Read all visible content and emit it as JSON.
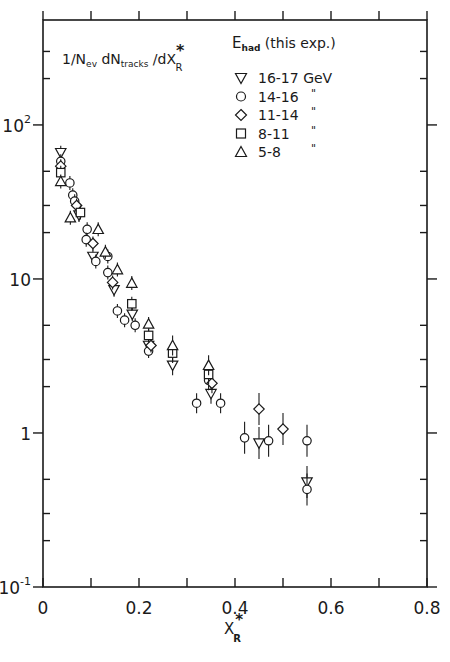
{
  "chart_data": {
    "type": "scatter",
    "title": "",
    "ylabel": "1/N_ev dN_tracks/dX_R*",
    "ylabel_parts": {
      "main": "1/N",
      "sub1": "ev",
      "mid": " dN",
      "sub2": "tracks",
      "tail": " /dX",
      "sup": "*",
      "sub3": "R"
    },
    "xlabel": "X_R*",
    "xlabel_parts": {
      "main": "X",
      "sup": "*",
      "sub": "R"
    },
    "xlim": [
      0,
      0.8
    ],
    "ylim": [
      0.1,
      480
    ],
    "yscale": "log",
    "grid": false,
    "x_ticks": [
      0,
      0.2,
      0.4,
      0.6,
      0.8
    ],
    "x_tick_labels": [
      "0",
      "0.2",
      "0.4",
      "0.6",
      "0.8"
    ],
    "x_minor_ticks": [
      0.1,
      0.3,
      0.5,
      0.7
    ],
    "y_tick_labels": [
      {
        "value": 100,
        "base": "10",
        "exp": "2"
      },
      {
        "value": 10,
        "base": "10",
        "exp": ""
      },
      {
        "value": 1,
        "base": "1",
        "exp": ""
      },
      {
        "value": 0.1,
        "base": "10",
        "exp": "-1"
      }
    ],
    "y_minor_ticks": [
      200,
      300,
      50,
      30,
      20,
      5,
      3,
      2,
      0.5,
      0.3,
      0.2
    ],
    "legend": {
      "title_main": "E",
      "title_sub": "had",
      "title_tail": " (this exp.)",
      "position": "upper right",
      "entries": [
        {
          "marker": "triangle-down",
          "label": "16-17 GeV"
        },
        {
          "marker": "circle",
          "label": "14-16",
          "ditto": "\""
        },
        {
          "marker": "diamond",
          "label": "11-14",
          "ditto": "\""
        },
        {
          "marker": "square",
          "label": "8-11",
          "ditto": "\""
        },
        {
          "marker": "triangle-up",
          "label": "5-8",
          "ditto": "\""
        }
      ]
    },
    "series": [
      {
        "name": "16-17 GeV",
        "marker": "triangle-down",
        "points": [
          {
            "x": 0.037,
            "y": 66
          },
          {
            "x": 0.075,
            "y": 26
          },
          {
            "x": 0.104,
            "y": 14
          },
          {
            "x": 0.148,
            "y": 8.5
          },
          {
            "x": 0.186,
            "y": 5.9
          },
          {
            "x": 0.22,
            "y": 3.7
          },
          {
            "x": 0.27,
            "y": 2.75
          },
          {
            "x": 0.35,
            "y": 1.8
          },
          {
            "x": 0.45,
            "y": 0.86
          },
          {
            "x": 0.55,
            "y": 0.48
          }
        ]
      },
      {
        "name": "14-16 GeV",
        "marker": "circle",
        "points": [
          {
            "x": 0.037,
            "y": 58
          },
          {
            "x": 0.056,
            "y": 42
          },
          {
            "x": 0.062,
            "y": 35
          },
          {
            "x": 0.066,
            "y": 32
          },
          {
            "x": 0.092,
            "y": 21
          },
          {
            "x": 0.09,
            "y": 18
          },
          {
            "x": 0.11,
            "y": 13
          },
          {
            "x": 0.135,
            "y": 14
          },
          {
            "x": 0.135,
            "y": 11
          },
          {
            "x": 0.155,
            "y": 6.2
          },
          {
            "x": 0.17,
            "y": 5.4
          },
          {
            "x": 0.192,
            "y": 5.0
          },
          {
            "x": 0.22,
            "y": 3.4
          },
          {
            "x": 0.32,
            "y": 1.56
          },
          {
            "x": 0.345,
            "y": 2.2
          },
          {
            "x": 0.37,
            "y": 1.56
          },
          {
            "x": 0.42,
            "y": 0.93
          },
          {
            "x": 0.47,
            "y": 0.89
          },
          {
            "x": 0.55,
            "y": 0.89
          },
          {
            "x": 0.55,
            "y": 0.43
          }
        ]
      },
      {
        "name": "11-14 GeV",
        "marker": "diamond",
        "points": [
          {
            "x": 0.037,
            "y": 54
          },
          {
            "x": 0.07,
            "y": 30
          },
          {
            "x": 0.104,
            "y": 17
          },
          {
            "x": 0.145,
            "y": 9.5
          },
          {
            "x": 0.225,
            "y": 3.7
          },
          {
            "x": 0.352,
            "y": 2.1
          },
          {
            "x": 0.45,
            "y": 1.43
          },
          {
            "x": 0.5,
            "y": 1.06
          }
        ]
      },
      {
        "name": "8-11 GeV",
        "marker": "square",
        "points": [
          {
            "x": 0.037,
            "y": 49
          },
          {
            "x": 0.078,
            "y": 27
          },
          {
            "x": 0.185,
            "y": 6.9
          },
          {
            "x": 0.22,
            "y": 4.3
          },
          {
            "x": 0.27,
            "y": 3.3
          },
          {
            "x": 0.345,
            "y": 2.4
          }
        ]
      },
      {
        "name": "5-8 GeV",
        "marker": "triangle-up",
        "points": [
          {
            "x": 0.037,
            "y": 43
          },
          {
            "x": 0.057,
            "y": 25
          },
          {
            "x": 0.115,
            "y": 21
          },
          {
            "x": 0.13,
            "y": 15
          },
          {
            "x": 0.155,
            "y": 11.5
          },
          {
            "x": 0.185,
            "y": 9.4
          },
          {
            "x": 0.22,
            "y": 5.1
          },
          {
            "x": 0.27,
            "y": 3.7
          },
          {
            "x": 0.345,
            "y": 2.75
          }
        ]
      }
    ]
  }
}
